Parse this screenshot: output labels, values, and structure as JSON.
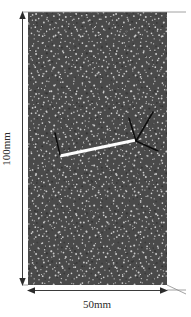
{
  "figure": {
    "background_color": "#ffffff"
  },
  "specimen": {
    "label": "speckle-pattern-specimen",
    "base_color": "#4a4a4a",
    "speckle_color": "#d8d8d8",
    "x": 28,
    "y": 12,
    "width": 139,
    "height": 273
  },
  "dimensions": {
    "height_label": "100mm",
    "width_label": "50mm",
    "line_color": "#3a3a3a",
    "text_color": "#2b2b2b"
  },
  "crack": {
    "main_color": "#fdfdfd",
    "branch_color": "#0d0d0d",
    "main_start": [
      60,
      156
    ],
    "main_end": [
      136,
      140
    ],
    "left_branch": [
      [
        60,
        156
      ],
      [
        55,
        133
      ]
    ],
    "right_branches": [
      [
        [
          136,
          140
        ],
        [
          129,
          119
        ]
      ],
      [
        [
          136,
          140
        ],
        [
          152,
          112
        ]
      ],
      [
        [
          136,
          140
        ],
        [
          157,
          150
        ]
      ]
    ]
  }
}
